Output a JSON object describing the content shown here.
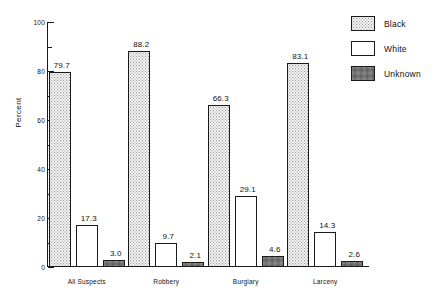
{
  "chart_data": {
    "type": "bar",
    "title": "",
    "subtitle": "",
    "xlabel": "",
    "ylabel": "Percent",
    "ylim": [
      0,
      100
    ],
    "yticks": [
      0,
      20,
      40,
      60,
      80,
      100
    ],
    "ytick_labels": [
      "0",
      "20",
      "40",
      "60",
      "80",
      "100"
    ],
    "yminor_ticks": [
      10,
      30,
      50,
      70,
      90
    ],
    "grid": false,
    "legend_position": "top-right",
    "categories": [
      "All Suspects",
      "Robbery",
      "Burglary",
      "Larceny"
    ],
    "series": [
      {
        "name": "Black",
        "fill": "light-stipple",
        "color": "#f2f2f2",
        "values": [
          79.7,
          88.2,
          66.3,
          83.1
        ],
        "labels": [
          "79.7",
          "88.2",
          "66.3",
          "83.1"
        ]
      },
      {
        "name": "White",
        "fill": "solid-white",
        "color": "#ffffff",
        "values": [
          17.3,
          9.7,
          29.1,
          14.3
        ],
        "labels": [
          "17.3",
          "9.7",
          "29.1",
          "14.3"
        ]
      },
      {
        "name": "Unknown",
        "fill": "dark-stipple",
        "color": "#b9b9b9",
        "values": [
          3.0,
          2.1,
          4.6,
          2.6
        ],
        "labels": [
          "3.0",
          "2.1",
          "4.6",
          "2.6"
        ]
      }
    ]
  },
  "legend": {
    "items": [
      {
        "label": "Black",
        "swatch": "black"
      },
      {
        "label": "White",
        "swatch": "white"
      },
      {
        "label": "Unknown",
        "swatch": "unknown"
      }
    ]
  },
  "axes": {
    "y_title": "Percent"
  }
}
